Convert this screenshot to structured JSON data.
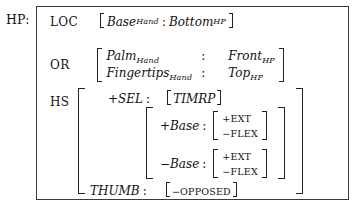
{
  "figure": {
    "root_label": "HP:",
    "notation": "attribute-value-matrix"
  },
  "rows": {
    "loc": {
      "attribute": "LOC",
      "value": {
        "left_bracket": "[",
        "feature": "Base",
        "feature_sub": "Hand",
        "separator": ":",
        "value": "Bottom",
        "value_sub": "HP",
        "right_bracket": "]"
      }
    },
    "or": {
      "attribute": "OR",
      "lines": [
        {
          "feature": "Palm",
          "feature_sub": "Hand",
          "separator": ":",
          "value": "Front",
          "value_sub": "HP"
        },
        {
          "feature": "Fingertips",
          "feature_sub": "Hand",
          "separator": ":",
          "value": "Top",
          "value_sub": "HP"
        }
      ]
    },
    "hs": {
      "attribute": "HS",
      "sel": {
        "label": "+SEL",
        "separator": ":",
        "left_bracket": "[",
        "value": "TIMRP",
        "right_bracket": "]"
      },
      "base_blocks": [
        {
          "label": "+Base",
          "separator": ":",
          "features": [
            "+EXT",
            "−FLEX"
          ]
        },
        {
          "label": "−Base",
          "separator": ":",
          "features": [
            "+EXT",
            "−FLEX"
          ]
        }
      ],
      "thumb": {
        "label": "THUMB",
        "separator": ":",
        "left_bracket": "[",
        "value": "−OPPOSED",
        "right_bracket": "]"
      }
    }
  },
  "colors": {
    "ink": "#111111",
    "rule": "#3a3a3a",
    "background": "#ffffff"
  }
}
